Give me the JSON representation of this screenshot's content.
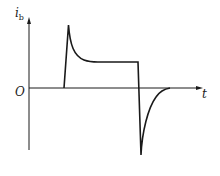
{
  "diagram": {
    "y_axis_label": "i",
    "y_axis_subscript": "b",
    "x_axis_label": "t",
    "origin_label": "O",
    "line_color": "#1a1a1a"
  }
}
